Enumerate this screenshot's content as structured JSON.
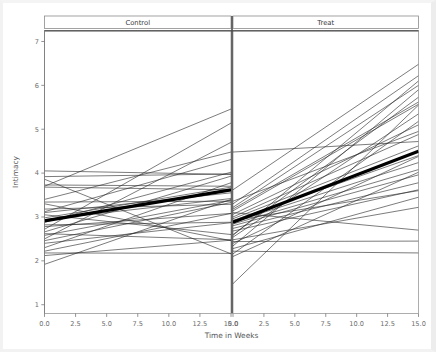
{
  "chart_data": {
    "type": "line",
    "title": "",
    "subtitle": "",
    "xlabel": "Time in Weeks",
    "ylabel": "Intimacy",
    "xlim": [
      0,
      15
    ],
    "ylim": [
      0.8,
      7.25
    ],
    "grid": false,
    "legend": null,
    "x": [
      0,
      15
    ],
    "xticks": [
      0,
      2.5,
      5,
      7.5,
      10,
      12.5,
      15
    ],
    "xticklabels": [
      "0.0",
      "2.5",
      "5.0",
      "7.5",
      "10.0",
      "12.5",
      "15.0"
    ],
    "yticks": [
      1,
      2,
      3,
      4,
      5,
      6,
      7
    ],
    "yticklabels": [
      "1",
      "2",
      "3",
      "4",
      "5",
      "6",
      "7"
    ],
    "panels": [
      {
        "label": "Control",
        "mean_line": {
          "name": "group mean",
          "x": [
            0,
            15
          ],
          "values": [
            2.91,
            3.62
          ],
          "linewidth": 3.2
        },
        "series": [
          {
            "name": "s1",
            "values": [
              4.05,
              3.97
            ]
          },
          {
            "name": "s2",
            "values": [
              3.92,
              3.98
            ]
          },
          {
            "name": "s3",
            "values": [
              3.86,
              2.16
            ]
          },
          {
            "name": "s4",
            "values": [
              3.73,
              3.7
            ]
          },
          {
            "name": "s5",
            "values": [
              3.7,
              5.46
            ]
          },
          {
            "name": "s6",
            "values": [
              3.68,
              3.62
            ]
          },
          {
            "name": "s7",
            "values": [
              3.4,
              4.48
            ]
          },
          {
            "name": "s8",
            "values": [
              3.34,
              3.36
            ]
          },
          {
            "name": "s9",
            "values": [
              3.3,
              2.46
            ]
          },
          {
            "name": "s10",
            "values": [
              3.18,
              3.29
            ]
          },
          {
            "name": "s11",
            "values": [
              3.12,
              4.31
            ]
          },
          {
            "name": "s12",
            "values": [
              3.1,
              3.55
            ]
          },
          {
            "name": "s13",
            "values": [
              3.05,
              2.6
            ]
          },
          {
            "name": "s14",
            "values": [
              2.98,
              3.68
            ]
          },
          {
            "name": "s15",
            "values": [
              2.94,
              3.42
            ]
          },
          {
            "name": "s16",
            "values": [
              2.88,
              4.02
            ]
          },
          {
            "name": "s17",
            "values": [
              2.82,
              2.88
            ]
          },
          {
            "name": "s18",
            "values": [
              2.78,
              3.08
            ]
          },
          {
            "name": "s19",
            "values": [
              2.72,
              5.14
            ]
          },
          {
            "name": "s20",
            "values": [
              2.66,
              3.93
            ]
          },
          {
            "name": "s21",
            "values": [
              2.62,
              2.48
            ]
          },
          {
            "name": "s22",
            "values": [
              2.58,
              3.38
            ]
          },
          {
            "name": "s23",
            "values": [
              2.5,
              4.7
            ]
          },
          {
            "name": "s24",
            "values": [
              2.46,
              3.33
            ]
          },
          {
            "name": "s25",
            "values": [
              2.4,
              2.87
            ]
          },
          {
            "name": "s26",
            "values": [
              2.3,
              3.78
            ]
          },
          {
            "name": "s27",
            "values": [
              2.22,
              3.08
            ]
          },
          {
            "name": "s28",
            "values": [
              2.12,
              2.47
            ]
          },
          {
            "name": "s29",
            "values": [
              1.92,
              3.4
            ]
          },
          {
            "name": "s30",
            "values": [
              2.18,
              2.17
            ]
          }
        ]
      },
      {
        "label": "Treat",
        "mean_line": {
          "name": "group mean",
          "x": [
            0,
            15
          ],
          "values": [
            2.88,
            4.5
          ],
          "linewidth": 3.2
        },
        "series": [
          {
            "name": "t1",
            "values": [
              4.48,
              4.72
            ]
          },
          {
            "name": "t2",
            "values": [
              3.62,
              6.48
            ]
          },
          {
            "name": "t3",
            "values": [
              3.3,
              6.22
            ]
          },
          {
            "name": "t4",
            "values": [
              3.22,
              6.0
            ]
          },
          {
            "name": "t5",
            "values": [
              3.18,
              5.62
            ]
          },
          {
            "name": "t6",
            "values": [
              3.14,
              5.57
            ]
          },
          {
            "name": "t7",
            "values": [
              3.1,
              2.7
            ]
          },
          {
            "name": "t8",
            "values": [
              3.06,
              5.1
            ]
          },
          {
            "name": "t9",
            "values": [
              3.0,
              4.88
            ]
          },
          {
            "name": "t10",
            "values": [
              2.96,
              4.62
            ]
          },
          {
            "name": "t11",
            "values": [
              2.92,
              4.4
            ]
          },
          {
            "name": "t12",
            "values": [
              2.88,
              4.24
            ]
          },
          {
            "name": "t13",
            "values": [
              2.84,
              4.08
            ]
          },
          {
            "name": "t14",
            "values": [
              2.8,
              3.96
            ]
          },
          {
            "name": "t15",
            "values": [
              2.74,
              3.78
            ]
          },
          {
            "name": "t16",
            "values": [
              2.68,
              3.62
            ]
          },
          {
            "name": "t17",
            "values": [
              2.6,
              5.73
            ]
          },
          {
            "name": "t18",
            "values": [
              2.54,
              5.35
            ]
          },
          {
            "name": "t19",
            "values": [
              2.48,
              3.22
            ]
          },
          {
            "name": "t20",
            "values": [
              2.44,
              2.45
            ]
          },
          {
            "name": "t21",
            "values": [
              2.4,
              4.38
            ]
          },
          {
            "name": "t22",
            "values": [
              2.34,
              5.9
            ]
          },
          {
            "name": "t23",
            "values": [
              2.28,
              3.45
            ]
          },
          {
            "name": "t24",
            "values": [
              2.22,
              2.18
            ]
          },
          {
            "name": "t25",
            "values": [
              2.16,
              5.18
            ]
          },
          {
            "name": "t26",
            "values": [
              2.1,
              4.02
            ]
          },
          {
            "name": "t27",
            "values": [
              1.48,
              5.55
            ]
          },
          {
            "name": "t28",
            "values": [
              2.58,
              6.1
            ]
          },
          {
            "name": "t29",
            "values": [
              3.36,
              4.95
            ]
          },
          {
            "name": "t30",
            "values": [
              2.92,
              3.6
            ]
          }
        ]
      }
    ]
  }
}
